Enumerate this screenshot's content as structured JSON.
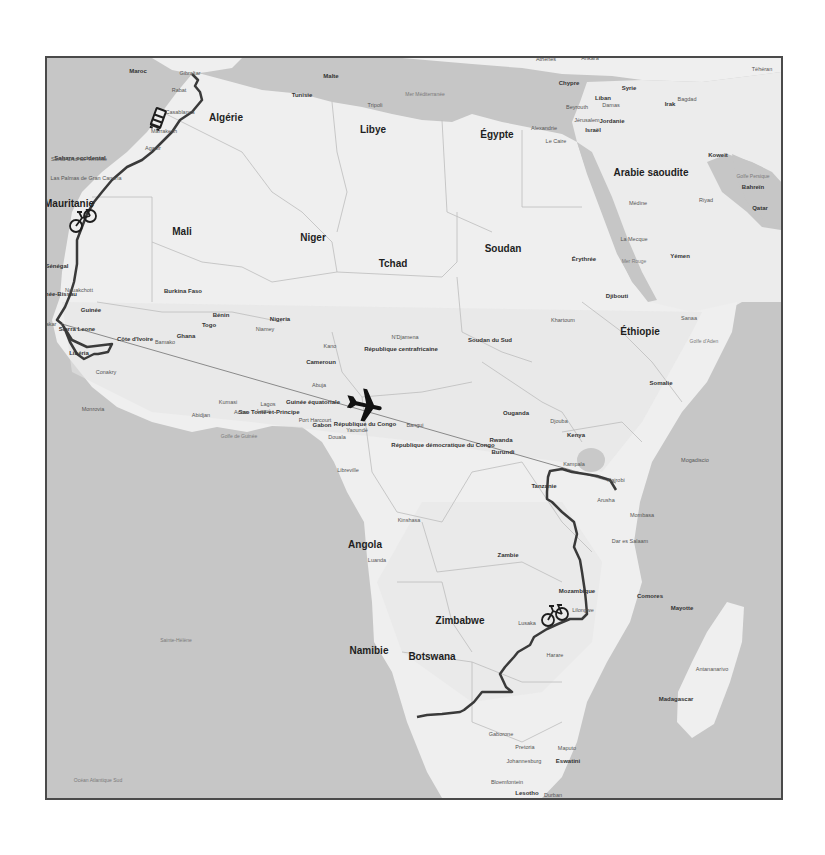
{
  "map": {
    "colors": {
      "water": "#c6c6c6",
      "land": "#efefef",
      "land_shade": "#e2e2e2",
      "border": "#bdbdbd",
      "route": "#3a3a3a",
      "flight_line": "#8a8a8a",
      "frame": "#4a4a4a"
    },
    "countries": [
      {
        "label": "Algérie",
        "x": 226,
        "y": 117
      },
      {
        "label": "Libye",
        "x": 373,
        "y": 129
      },
      {
        "label": "Égypte",
        "x": 497,
        "y": 134
      },
      {
        "label": "Arabie saoudite",
        "x": 651,
        "y": 172
      },
      {
        "label": "Mauritanie",
        "x": 69,
        "y": 203
      },
      {
        "label": "Mali",
        "x": 182,
        "y": 231
      },
      {
        "label": "Niger",
        "x": 313,
        "y": 237
      },
      {
        "label": "Tchad",
        "x": 393,
        "y": 263
      },
      {
        "label": "Soudan",
        "x": 503,
        "y": 248
      },
      {
        "label": "Éthiopie",
        "x": 640,
        "y": 331
      },
      {
        "label": "Angola",
        "x": 365,
        "y": 544
      },
      {
        "label": "Botswana",
        "x": 432,
        "y": 656
      },
      {
        "label": "Namibie",
        "x": 369,
        "y": 650
      },
      {
        "label": "Zimbabwe",
        "x": 460,
        "y": 620
      }
    ],
    "small_countries": [
      {
        "label": "Maroc",
        "x": 138,
        "y": 71
      },
      {
        "label": "Sahara occidental",
        "x": 80,
        "y": 158
      },
      {
        "label": "Sénégal",
        "x": 57,
        "y": 266
      },
      {
        "label": "Guinée-Bissau",
        "x": 56,
        "y": 294
      },
      {
        "label": "Guinée",
        "x": 91,
        "y": 310
      },
      {
        "label": "Sierra Leone",
        "x": 77,
        "y": 329
      },
      {
        "label": "Libéria",
        "x": 79,
        "y": 353
      },
      {
        "label": "Côte d'Ivoire",
        "x": 135,
        "y": 339
      },
      {
        "label": "Burkina Faso",
        "x": 183,
        "y": 291
      },
      {
        "label": "Ghana",
        "x": 186,
        "y": 336
      },
      {
        "label": "Togo",
        "x": 209,
        "y": 325
      },
      {
        "label": "Bénin",
        "x": 221,
        "y": 315
      },
      {
        "label": "Nigeria",
        "x": 280,
        "y": 319
      },
      {
        "label": "Cameroun",
        "x": 321,
        "y": 362
      },
      {
        "label": "République centrafricaine",
        "x": 401,
        "y": 349
      },
      {
        "label": "Soudan du Sud",
        "x": 490,
        "y": 340
      },
      {
        "label": "Érythrée",
        "x": 584,
        "y": 259
      },
      {
        "label": "Djibouti",
        "x": 617,
        "y": 296
      },
      {
        "label": "Yémen",
        "x": 680,
        "y": 256
      },
      {
        "label": "Somalie",
        "x": 661,
        "y": 383
      },
      {
        "label": "Ouganda",
        "x": 516,
        "y": 413
      },
      {
        "label": "Kenya",
        "x": 576,
        "y": 435
      },
      {
        "label": "Rwanda",
        "x": 501,
        "y": 440
      },
      {
        "label": "Burundi",
        "x": 503,
        "y": 452
      },
      {
        "label": "Tanzanie",
        "x": 544,
        "y": 486
      },
      {
        "label": "République démocratique du Congo",
        "x": 443,
        "y": 445
      },
      {
        "label": "République du Congo",
        "x": 365,
        "y": 424
      },
      {
        "label": "Gabon",
        "x": 322,
        "y": 425
      },
      {
        "label": "Guinée équatoriale",
        "x": 313,
        "y": 402
      },
      {
        "label": "Zambie",
        "x": 508,
        "y": 555
      },
      {
        "label": "Mozambique",
        "x": 577,
        "y": 591
      },
      {
        "label": "Madagascar",
        "x": 676,
        "y": 699
      },
      {
        "label": "Tunisie",
        "x": 302,
        "y": 95
      },
      {
        "label": "Syrie",
        "x": 629,
        "y": 88
      },
      {
        "label": "Irak",
        "x": 670,
        "y": 104
      },
      {
        "label": "Jordanie",
        "x": 612,
        "y": 121
      },
      {
        "label": "Israël",
        "x": 593,
        "y": 130
      },
      {
        "label": "Liban",
        "x": 603,
        "y": 98
      },
      {
        "label": "Chypre",
        "x": 569,
        "y": 83
      },
      {
        "label": "Koweït",
        "x": 718,
        "y": 155
      },
      {
        "label": "Bahreïn",
        "x": 753,
        "y": 187
      },
      {
        "label": "Qatar",
        "x": 760,
        "y": 208
      },
      {
        "label": "Malte",
        "x": 331,
        "y": 76
      },
      {
        "label": "Mayotte",
        "x": 682,
        "y": 608
      },
      {
        "label": "Comores",
        "x": 650,
        "y": 596
      },
      {
        "label": "Sao Tomé-et-Principe",
        "x": 269,
        "y": 412
      },
      {
        "label": "Eswatini",
        "x": 568,
        "y": 761
      },
      {
        "label": "Lesotho",
        "x": 527,
        "y": 793
      }
    ],
    "cities": [
      {
        "label": "Gibraltar",
        "x": 190,
        "y": 73
      },
      {
        "label": "Rabat",
        "x": 179,
        "y": 90
      },
      {
        "label": "Casablanca",
        "x": 180,
        "y": 112
      },
      {
        "label": "Marrakech",
        "x": 164,
        "y": 131
      },
      {
        "label": "Agadir",
        "x": 153,
        "y": 148
      },
      {
        "label": "Santa Cruz de Tenerife",
        "x": 79,
        "y": 159
      },
      {
        "label": "Las Palmas de Gran Canaria",
        "x": 86,
        "y": 178
      },
      {
        "label": "Nouakchott",
        "x": 79,
        "y": 290
      },
      {
        "label": "Dakar",
        "x": 49,
        "y": 324
      },
      {
        "label": "Bamako",
        "x": 165,
        "y": 342
      },
      {
        "label": "Niamey",
        "x": 265,
        "y": 329
      },
      {
        "label": "Conakry",
        "x": 106,
        "y": 372
      },
      {
        "label": "Monrovia",
        "x": 93,
        "y": 409
      },
      {
        "label": "Abidjan",
        "x": 201,
        "y": 415
      },
      {
        "label": "Kumasi",
        "x": 228,
        "y": 402
      },
      {
        "label": "Accra",
        "x": 241,
        "y": 412
      },
      {
        "label": "Lomé",
        "x": 264,
        "y": 411
      },
      {
        "label": "Lagos",
        "x": 268,
        "y": 404
      },
      {
        "label": "Kano",
        "x": 330,
        "y": 346
      },
      {
        "label": "Abuja",
        "x": 319,
        "y": 385
      },
      {
        "label": "N'Djamena",
        "x": 405,
        "y": 337
      },
      {
        "label": "Port Harcourt",
        "x": 315,
        "y": 420
      },
      {
        "label": "Yaoundé",
        "x": 357,
        "y": 430
      },
      {
        "label": "Douala",
        "x": 337,
        "y": 437
      },
      {
        "label": "Bangui",
        "x": 415,
        "y": 425
      },
      {
        "label": "Libreville",
        "x": 348,
        "y": 470
      },
      {
        "label": "Kinshasa",
        "x": 409,
        "y": 520
      },
      {
        "label": "Luanda",
        "x": 377,
        "y": 560
      },
      {
        "label": "Tripoli",
        "x": 375,
        "y": 105
      },
      {
        "label": "Alexandrie",
        "x": 544,
        "y": 128
      },
      {
        "label": "Le Caire",
        "x": 556,
        "y": 141
      },
      {
        "label": "Beyrouth",
        "x": 577,
        "y": 107
      },
      {
        "label": "Damas",
        "x": 611,
        "y": 105
      },
      {
        "label": "Jérusalem",
        "x": 587,
        "y": 120
      },
      {
        "label": "Bagdad",
        "x": 687,
        "y": 99
      },
      {
        "label": "Téhéran",
        "x": 762,
        "y": 69
      },
      {
        "label": "Athènes",
        "x": 546,
        "y": 59
      },
      {
        "label": "Ankara",
        "x": 590,
        "y": 58
      },
      {
        "label": "Médine",
        "x": 638,
        "y": 203
      },
      {
        "label": "La Mecque",
        "x": 634,
        "y": 239
      },
      {
        "label": "Riyad",
        "x": 706,
        "y": 200
      },
      {
        "label": "Khartoum",
        "x": 563,
        "y": 320
      },
      {
        "label": "Sanaa",
        "x": 689,
        "y": 318
      },
      {
        "label": "Djouba",
        "x": 559,
        "y": 421
      },
      {
        "label": "Mogadiscio",
        "x": 695,
        "y": 460
      },
      {
        "label": "Kampala",
        "x": 574,
        "y": 464
      },
      {
        "label": "Nairobi",
        "x": 616,
        "y": 480
      },
      {
        "label": "Arusha",
        "x": 606,
        "y": 500
      },
      {
        "label": "Mombasa",
        "x": 642,
        "y": 515
      },
      {
        "label": "Dar es Salaam",
        "x": 630,
        "y": 541
      },
      {
        "label": "Lusaka",
        "x": 527,
        "y": 623
      },
      {
        "label": "Harare",
        "x": 555,
        "y": 655
      },
      {
        "label": "Lilongwe",
        "x": 583,
        "y": 610
      },
      {
        "label": "Gaborone",
        "x": 501,
        "y": 734
      },
      {
        "label": "Pretoria",
        "x": 525,
        "y": 747
      },
      {
        "label": "Johannesburg",
        "x": 524,
        "y": 761
      },
      {
        "label": "Maputo",
        "x": 567,
        "y": 748
      },
      {
        "label": "Bloemfontein",
        "x": 507,
        "y": 782
      },
      {
        "label": "Durban",
        "x": 553,
        "y": 795
      },
      {
        "label": "Antananarivo",
        "x": 712,
        "y": 669
      }
    ],
    "seas": [
      {
        "label": "Mer Méditerranée",
        "x": 425,
        "y": 95
      },
      {
        "label": "Golfe de Guinée",
        "x": 239,
        "y": 437
      },
      {
        "label": "Golfe d'Aden",
        "x": 704,
        "y": 342
      },
      {
        "label": "Mer Rouge",
        "x": 634,
        "y": 262
      },
      {
        "label": "Golfe Persique",
        "x": 753,
        "y": 177
      },
      {
        "label": "Océan Atlantique Sud",
        "x": 98,
        "y": 781
      },
      {
        "label": "Sainte-Hélène",
        "x": 176,
        "y": 641
      }
    ],
    "transport_icons": [
      {
        "name": "bus-icon",
        "x": 156,
        "y": 117
      },
      {
        "name": "bicycle-icon",
        "x": 81,
        "y": 219
      },
      {
        "name": "airplane-icon",
        "x": 362,
        "y": 402
      },
      {
        "name": "bicycle-icon",
        "x": 553,
        "y": 614
      }
    ]
  }
}
